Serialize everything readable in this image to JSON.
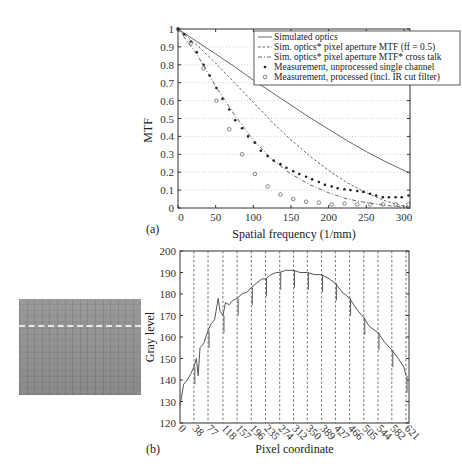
{
  "chart_data": [
    {
      "type": "line",
      "panel_label": "(a)",
      "title": "",
      "xlabel": "Spatial frequency (1/mm)",
      "ylabel": "MTF",
      "xlim": [
        0,
        308
      ],
      "ylim": [
        0,
        1
      ],
      "xticks": [
        0,
        50,
        100,
        150,
        200,
        250,
        300
      ],
      "yticks": [
        0,
        0.1,
        0.2,
        0.3,
        0.4,
        0.5,
        0.6,
        0.7,
        0.8,
        0.9,
        1
      ],
      "ytick_labels": [
        "0",
        "0.1",
        "0.2",
        "0.3",
        "0.4",
        "0.5",
        "0.6",
        "0.7",
        "0.8",
        "0.9",
        "1"
      ],
      "grid": "horizontal dotted",
      "legend_position": "upper right",
      "series": [
        {
          "name": "Simulated optics",
          "style": "solid",
          "x": [
            0,
            25,
            50,
            75,
            100,
            125,
            150,
            175,
            200,
            225,
            250,
            275,
            300,
            308
          ],
          "y": [
            1.0,
            0.93,
            0.86,
            0.79,
            0.715,
            0.645,
            0.575,
            0.505,
            0.44,
            0.375,
            0.315,
            0.26,
            0.21,
            0.195
          ]
        },
        {
          "name": "Sim. optics* pixel aperture MTF (ff = 0.5)",
          "style": "dashed",
          "x": [
            0,
            25,
            50,
            75,
            100,
            125,
            150,
            175,
            200,
            225,
            250,
            275,
            300,
            308
          ],
          "y": [
            1.0,
            0.91,
            0.81,
            0.7,
            0.59,
            0.48,
            0.38,
            0.29,
            0.21,
            0.14,
            0.085,
            0.04,
            0.01,
            0.005
          ]
        },
        {
          "name": "Sim. optics* pixel aperture MTF* cross talk",
          "style": "dashdot",
          "x": [
            0,
            25,
            50,
            75,
            100,
            125,
            150,
            175,
            200,
            225,
            250,
            275,
            300,
            308
          ],
          "y": [
            1.0,
            0.86,
            0.68,
            0.52,
            0.38,
            0.27,
            0.19,
            0.13,
            0.085,
            0.05,
            0.03,
            0.015,
            0.005,
            0.0
          ]
        },
        {
          "name": "Measurement, unprocessed single channel",
          "style": "marker-dot",
          "x": [
            0,
            8,
            17,
            25,
            34,
            42,
            51,
            59,
            68,
            76,
            85,
            93,
            102,
            110,
            119,
            127,
            136,
            144,
            153,
            161,
            170,
            178,
            187,
            195,
            204,
            212,
            221,
            229,
            238,
            246,
            255,
            263,
            272,
            280,
            289,
            297,
            306
          ],
          "y": [
            1.0,
            0.97,
            0.93,
            0.87,
            0.8,
            0.74,
            0.67,
            0.61,
            0.55,
            0.49,
            0.445,
            0.4,
            0.365,
            0.32,
            0.29,
            0.265,
            0.245,
            0.225,
            0.205,
            0.19,
            0.175,
            0.16,
            0.145,
            0.13,
            0.12,
            0.11,
            0.105,
            0.1,
            0.095,
            0.09,
            0.08,
            0.07,
            0.06,
            0.06,
            0.06,
            0.06,
            0.07
          ]
        },
        {
          "name": "Measurement, processed (incl. IR cut filter)",
          "style": "marker-circle",
          "x": [
            0,
            17,
            34,
            51,
            68,
            85,
            102,
            119,
            136,
            153,
            170,
            187,
            204,
            221,
            238,
            255,
            272,
            289,
            306
          ],
          "y": [
            1.0,
            0.92,
            0.78,
            0.6,
            0.44,
            0.3,
            0.19,
            0.12,
            0.075,
            0.05,
            0.035,
            0.03,
            0.02,
            0.025,
            0.02,
            0.02,
            0.02,
            0.02,
            0.02
          ]
        }
      ]
    },
    {
      "type": "line",
      "panel_label": "(b)",
      "title": "",
      "xlabel": "Pixel coordinate",
      "ylabel": "Gray level",
      "xlim": [
        0,
        621
      ],
      "ylim": [
        120,
        200
      ],
      "xticks": [
        0,
        38,
        77,
        118,
        157,
        196,
        235,
        274,
        312,
        350,
        389,
        427,
        466,
        505,
        544,
        582,
        621
      ],
      "yticks": [
        120,
        130,
        140,
        150,
        160,
        170,
        180,
        190,
        200
      ],
      "vertical_dashed_lines_at": [
        38,
        77,
        118,
        157,
        196,
        235,
        274,
        312,
        350,
        389,
        427,
        466,
        505,
        544,
        582,
        621
      ],
      "series": [
        {
          "name": "Gray level profile",
          "style": "solid",
          "x": [
            0,
            10,
            20,
            30,
            38,
            45,
            50,
            55,
            65,
            77,
            85,
            95,
            105,
            110,
            118,
            125,
            135,
            145,
            157,
            170,
            185,
            196,
            210,
            225,
            235,
            250,
            265,
            274,
            290,
            312,
            330,
            350,
            370,
            389,
            410,
            427,
            445,
            466,
            485,
            505,
            520,
            544,
            560,
            582,
            600,
            615,
            621
          ],
          "y": [
            128,
            138,
            140,
            143,
            146,
            150,
            142,
            155,
            157,
            163,
            166,
            168,
            178,
            172,
            170,
            176,
            175,
            177,
            178,
            180,
            181,
            183,
            185,
            187,
            187,
            189,
            190,
            190,
            191,
            191,
            190,
            190,
            189,
            189,
            187,
            185,
            181,
            178,
            173,
            169,
            165,
            162,
            158,
            154,
            150,
            146,
            142
          ]
        }
      ]
    }
  ],
  "legend": {
    "items": [
      "Simulated optics",
      "Sim. optics* pixel aperture MTF (ff = 0.5)",
      "Sim. optics* pixel aperture MTF* cross talk",
      "Measurement, unprocessed single channel",
      "Measurement, processed (incl. IR cut filter)"
    ]
  },
  "thumbnail": {
    "description": "sensor image with dashed scan line"
  },
  "colors": {
    "line": "#555555",
    "axis": "#333333",
    "grid": "#b0b0b0",
    "dashed_vertical": "#444444"
  }
}
